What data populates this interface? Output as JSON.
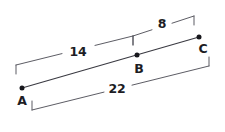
{
  "diagram": {
    "type": "geometry-line-diagram",
    "colors": {
      "background": "#ffffff",
      "line": "#3a3a42",
      "dimension": "#53535c",
      "text": "#1d1d24",
      "point": "#17171c"
    },
    "points": [
      {
        "id": "A",
        "label": "A",
        "x": 22,
        "y": 88,
        "label_x": 22,
        "label_y": 101
      },
      {
        "id": "B",
        "label": "B",
        "x": 137,
        "y": 55,
        "label_x": 139,
        "label_y": 69
      },
      {
        "id": "C",
        "label": "C",
        "x": 199,
        "y": 37,
        "label_x": 203,
        "label_y": 49
      }
    ],
    "main_segment": {
      "name": "segment-AC",
      "from": "A",
      "to": "C",
      "x1": 22,
      "y1": 88,
      "x2": 199,
      "y2": 37
    },
    "dimensions": [
      {
        "id": "dim-AB",
        "value": "14",
        "measures": "A to B",
        "x1": 16,
        "y1": 65,
        "x2": 133,
        "y2": 36,
        "gap_start": 62,
        "gap_end": 95,
        "label_x": 78,
        "label_y": 52,
        "tick_dx": 0,
        "tick_dy": 9
      },
      {
        "id": "dim-BC",
        "value": "8",
        "measures": "B to C",
        "x1": 133,
        "y1": 36,
        "x2": 194,
        "y2": 16,
        "gap_start": 152,
        "gap_end": 172,
        "label_x": 162,
        "label_y": 24,
        "tick_dx": 0,
        "tick_dy": 9
      },
      {
        "id": "dim-AC",
        "value": "22",
        "measures": "A to C",
        "x1": 32,
        "y1": 110,
        "x2": 209,
        "y2": 66,
        "gap_start": 104,
        "gap_end": 132,
        "label_x": 117,
        "label_y": 89,
        "tick_dx": 0,
        "tick_dy": -9
      }
    ]
  }
}
